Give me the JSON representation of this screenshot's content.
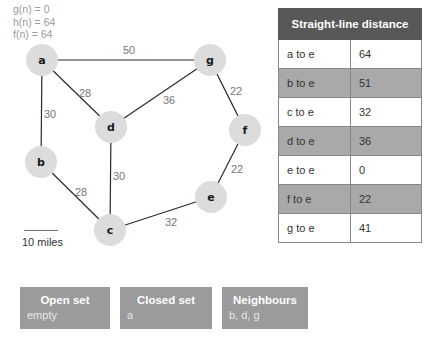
{
  "stats": {
    "g": "g(n) = 0",
    "h": "h(n) = 64",
    "f": "f(n) = 64"
  },
  "graph": {
    "nodes": [
      {
        "id": "a",
        "x": 42,
        "y": 60
      },
      {
        "id": "g",
        "x": 210,
        "y": 60
      },
      {
        "id": "d",
        "x": 111,
        "y": 127
      },
      {
        "id": "f",
        "x": 245,
        "y": 130
      },
      {
        "id": "b",
        "x": 41,
        "y": 162
      },
      {
        "id": "e",
        "x": 211,
        "y": 197
      },
      {
        "id": "c",
        "x": 110,
        "y": 230
      }
    ],
    "edges": [
      {
        "from": "a",
        "to": "g",
        "weight": "50"
      },
      {
        "from": "a",
        "to": "d",
        "weight": "28"
      },
      {
        "from": "a",
        "to": "b",
        "weight": "30"
      },
      {
        "from": "g",
        "to": "d",
        "weight": "36"
      },
      {
        "from": "g",
        "to": "f",
        "weight": "22"
      },
      {
        "from": "d",
        "to": "c",
        "weight": "30"
      },
      {
        "from": "b",
        "to": "c",
        "weight": "28"
      },
      {
        "from": "f",
        "to": "e",
        "weight": "22"
      },
      {
        "from": "c",
        "to": "e",
        "weight": "32"
      }
    ],
    "scale_label": "10 miles"
  },
  "table": {
    "title": "Straight-line distance",
    "rows": [
      {
        "label": "a to e",
        "value": "64"
      },
      {
        "label": "b to e",
        "value": "51"
      },
      {
        "label": "c to e",
        "value": "32"
      },
      {
        "label": "d to e",
        "value": "36"
      },
      {
        "label": "e to e",
        "value": "0"
      },
      {
        "label": "f to e",
        "value": "22"
      },
      {
        "label": "g to e",
        "value": "41"
      }
    ]
  },
  "sets": {
    "open": {
      "title": "Open set",
      "value": "empty"
    },
    "closed": {
      "title": "Closed set",
      "value": "a"
    },
    "neighbours": {
      "title": "Neighbours",
      "value": "b, d, g"
    }
  },
  "colors": {
    "node_fill": "#dcdcdc",
    "table_header": "#585858",
    "table_shade": "#a9a9a9",
    "set_box": "#9b9b9b"
  }
}
